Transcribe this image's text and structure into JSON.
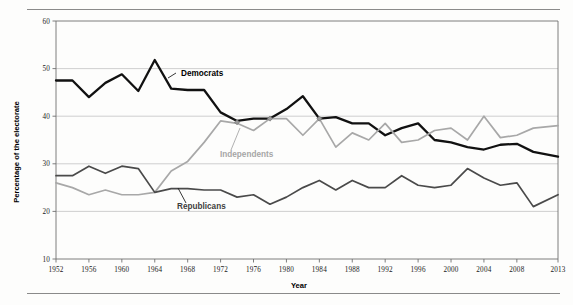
{
  "chart_data": {
    "type": "line",
    "title": "",
    "xlabel": "Year",
    "ylabel": "Percentage of the electorate",
    "xlim": [
      1952,
      2013
    ],
    "ylim": [
      10,
      60
    ],
    "yticks": [
      10,
      20,
      30,
      40,
      50,
      60
    ],
    "xticks": [
      1952,
      1956,
      1960,
      1964,
      1968,
      1972,
      1976,
      1980,
      1984,
      1988,
      1992,
      1996,
      2000,
      2004,
      2008,
      2013
    ],
    "grid": "horizontal",
    "legend_position": "inline-annotations",
    "x": [
      1952,
      1954,
      1956,
      1958,
      1960,
      1962,
      1964,
      1966,
      1968,
      1970,
      1972,
      1974,
      1976,
      1978,
      1980,
      1982,
      1984,
      1986,
      1988,
      1990,
      1992,
      1994,
      1996,
      1998,
      2000,
      2002,
      2004,
      2006,
      2008,
      2010,
      2013
    ],
    "series": [
      {
        "name": "Democrats",
        "color": "#111111",
        "values": [
          47.5,
          47.5,
          44.0,
          47.0,
          48.8,
          45.3,
          51.8,
          45.8,
          45.5,
          45.5,
          40.8,
          39.0,
          39.5,
          39.5,
          41.5,
          44.2,
          39.5,
          39.8,
          38.5,
          38.5,
          36.0,
          37.5,
          38.5,
          35.0,
          34.5,
          33.5,
          33.0,
          34.0,
          34.2,
          32.5,
          31.5
        ]
      },
      {
        "name": "Independents",
        "color": "#a8a8a8",
        "values": [
          26.0,
          25.0,
          23.5,
          24.5,
          23.5,
          23.5,
          24.0,
          28.5,
          30.5,
          34.5,
          39.0,
          38.5,
          37.0,
          39.5,
          39.5,
          36.0,
          39.5,
          33.5,
          36.5,
          35.0,
          38.5,
          34.5,
          35.0,
          37.0,
          37.5,
          35.0,
          40.0,
          35.5,
          36.0,
          37.5,
          38.0
        ]
      },
      {
        "name": "Republicans",
        "color": "#4a4a4a",
        "values": [
          27.5,
          27.5,
          29.5,
          28.0,
          29.5,
          29.0,
          24.0,
          24.8,
          24.8,
          24.5,
          24.5,
          23.0,
          23.5,
          21.5,
          23.0,
          25.0,
          26.5,
          24.5,
          26.5,
          25.0,
          25.0,
          27.5,
          25.5,
          25.0,
          25.5,
          29.0,
          27.0,
          25.5,
          26.0,
          21.0,
          23.5
        ]
      }
    ],
    "annotations": [
      {
        "text": "Democrats",
        "series": "Democrats"
      },
      {
        "text": "Independents",
        "series": "Independents"
      },
      {
        "text": "Republicans",
        "series": "Republicans"
      }
    ]
  }
}
